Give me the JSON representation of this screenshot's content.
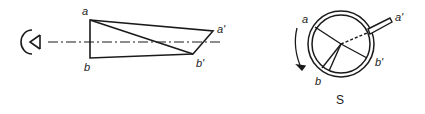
{
  "diagram": {
    "left_view": {
      "labels": {
        "a": "a",
        "b": "b",
        "a_prime": "a'",
        "b_prime": "b'"
      },
      "elements": [
        "eye-symbol",
        "optical-axis",
        "prism"
      ]
    },
    "right_view": {
      "labels": {
        "a": "a",
        "b": "b",
        "a_prime": "a'",
        "b_prime": "b'"
      },
      "caption": "S",
      "elements": [
        "circular-ring",
        "radial-lines",
        "rod",
        "rotation-arrow"
      ]
    },
    "colors": {
      "stroke": "#1a1a1a",
      "background": "#ffffff"
    }
  }
}
